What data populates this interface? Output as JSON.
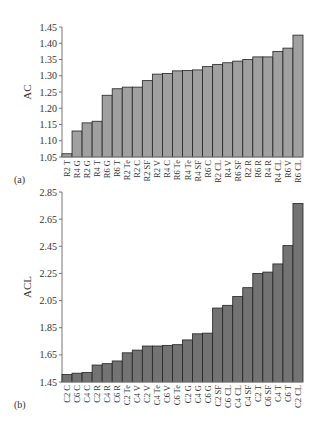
{
  "chart_data": [
    {
      "type": "bar",
      "panel": "(a)",
      "title": "",
      "xlabel": "",
      "ylabel": "AC",
      "ylim": [
        1.05,
        1.45
      ],
      "yticks": [
        "1.05",
        "1.10",
        "1.15",
        "1.20",
        "1.25",
        "1.30",
        "1.35",
        "1.40",
        "1.45"
      ],
      "grid": false,
      "bar_color": "#a0a0a0",
      "categories": [
        "R2 T",
        "R4 G",
        "R2 G",
        "R4 T",
        "R6 G",
        "R6 T",
        "R2 Te",
        "R2 C",
        "R2 SF",
        "R2 V",
        "R4 C",
        "R6 Te",
        "R4 Te",
        "R4 SF",
        "R6 C",
        "R2 CL",
        "R4 V",
        "R6 SF",
        "R2 R",
        "R6 R",
        "R4 R",
        "R4 CL",
        "R6 V",
        "R6 CL"
      ],
      "values": [
        1.06,
        1.13,
        1.155,
        1.16,
        1.24,
        1.26,
        1.265,
        1.265,
        1.285,
        1.305,
        1.307,
        1.315,
        1.316,
        1.318,
        1.328,
        1.335,
        1.34,
        1.345,
        1.35,
        1.358,
        1.358,
        1.375,
        1.385,
        1.425
      ]
    },
    {
      "type": "bar",
      "panel": "(b)",
      "title": "",
      "xlabel": "",
      "ylabel": "ACL",
      "ylim": [
        1.45,
        2.85
      ],
      "yticks": [
        "1.45",
        "1.65",
        "1.85",
        "2.05",
        "2.25",
        "2.45",
        "2.65",
        "2.85"
      ],
      "grid": false,
      "bar_color": "#737373",
      "categories": [
        "C2 C",
        "C6 C",
        "C4 C",
        "C2 R",
        "C4 R",
        "C6 R",
        "C2 Te",
        "C4 V",
        "C2 V",
        "C4 Te",
        "C6 V",
        "C6 Te",
        "C2 G",
        "C4 G",
        "C6 G",
        "C2 SF",
        "C6 CL",
        "C4 CL",
        "C4 SF",
        "C2 T",
        "C6 SF",
        "C4 T",
        "C6 T",
        "C2 CL"
      ],
      "values": [
        1.505,
        1.515,
        1.52,
        1.575,
        1.585,
        1.605,
        1.665,
        1.685,
        1.715,
        1.715,
        1.72,
        1.725,
        1.76,
        1.805,
        1.81,
        1.995,
        2.015,
        2.08,
        2.145,
        2.25,
        2.26,
        2.32,
        2.455,
        2.765
      ]
    }
  ]
}
